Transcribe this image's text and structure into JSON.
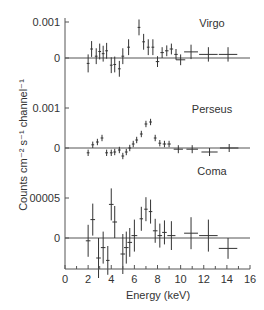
{
  "chart_data": {
    "type": "scatter",
    "title": "",
    "xlabel": "Energy (keV)",
    "ylabel": "Counts cm⁻² s⁻¹ channel⁻¹",
    "xlim": [
      0,
      16
    ],
    "x_ticks": [
      0,
      2,
      4,
      6,
      8,
      10,
      12,
      14,
      16
    ],
    "x_tick_labels": [
      "0",
      "2",
      "4",
      "6",
      "8",
      "10",
      "12",
      "14",
      "16"
    ],
    "grid": false,
    "panels": [
      {
        "name": "Virgo",
        "y_ticks": [
          0,
          0.001
        ],
        "y_tick_labels": [
          "0",
          "0.001"
        ],
        "ylim": [
          -0.0005,
          0.0011
        ],
        "points": [
          {
            "x": 2.0,
            "y": -0.00015,
            "xerr": 0.12,
            "yerr": 0.00025
          },
          {
            "x": 2.3,
            "y": 0.00025,
            "xerr": 0.12,
            "yerr": 0.00022
          },
          {
            "x": 2.7,
            "y": 5e-05,
            "xerr": 0.12,
            "yerr": 0.00022
          },
          {
            "x": 3.0,
            "y": 0.00018,
            "xerr": 0.12,
            "yerr": 0.00022
          },
          {
            "x": 3.3,
            "y": 0.00012,
            "xerr": 0.12,
            "yerr": 0.00022
          },
          {
            "x": 3.6,
            "y": 0.0002,
            "xerr": 0.12,
            "yerr": 0.00022
          },
          {
            "x": 4.0,
            "y": -0.0002,
            "xerr": 0.12,
            "yerr": 0.00022
          },
          {
            "x": 4.3,
            "y": -0.00018,
            "xerr": 0.12,
            "yerr": 0.00022
          },
          {
            "x": 4.7,
            "y": -0.0003,
            "xerr": 0.12,
            "yerr": 0.00022
          },
          {
            "x": 5.0,
            "y": 5e-05,
            "xerr": 0.12,
            "yerr": 0.00022
          },
          {
            "x": 5.5,
            "y": 0.0003,
            "xerr": 0.12,
            "yerr": 0.00022
          },
          {
            "x": 6.4,
            "y": 0.00085,
            "xerr": 0.12,
            "yerr": 0.00022
          },
          {
            "x": 6.8,
            "y": 0.00045,
            "xerr": 0.12,
            "yerr": 0.00022
          },
          {
            "x": 7.2,
            "y": 0.0003,
            "xerr": 0.12,
            "yerr": 0.00022
          },
          {
            "x": 7.6,
            "y": 0.0003,
            "xerr": 0.12,
            "yerr": 0.00022
          },
          {
            "x": 8.0,
            "y": -0.0001,
            "xerr": 0.15,
            "yerr": 0.00015
          },
          {
            "x": 8.4,
            "y": 0.00015,
            "xerr": 0.15,
            "yerr": 0.00015
          },
          {
            "x": 8.8,
            "y": 0.0002,
            "xerr": 0.15,
            "yerr": 0.00015
          },
          {
            "x": 9.2,
            "y": 0.00025,
            "xerr": 0.15,
            "yerr": 0.00015
          },
          {
            "x": 9.6,
            "y": 0.0001,
            "xerr": 0.15,
            "yerr": 0.00015
          },
          {
            "x": 10.0,
            "y": -5e-05,
            "xerr": 0.4,
            "yerr": 0.00015
          },
          {
            "x": 10.9,
            "y": 0.00017,
            "xerr": 0.6,
            "yerr": 0.0002
          },
          {
            "x": 12.4,
            "y": 0.0001,
            "xerr": 0.8,
            "yerr": 0.0002
          },
          {
            "x": 14.1,
            "y": 0.0001,
            "xerr": 0.8,
            "yerr": 0.0002
          }
        ]
      },
      {
        "name": "Perseus",
        "y_ticks": [
          0,
          0.001
        ],
        "y_tick_labels": [
          "0",
          "0.001"
        ],
        "ylim": [
          -0.0004,
          0.0011
        ],
        "points": [
          {
            "x": 2.0,
            "y": -0.00012,
            "xerr": 0.12,
            "yerr": 8e-05
          },
          {
            "x": 2.4,
            "y": 8e-05,
            "xerr": 0.12,
            "yerr": 8e-05
          },
          {
            "x": 2.8,
            "y": 0.00015,
            "xerr": 0.12,
            "yerr": 8e-05
          },
          {
            "x": 3.2,
            "y": 0.00025,
            "xerr": 0.12,
            "yerr": 8e-05
          },
          {
            "x": 3.6,
            "y": -0.00012,
            "xerr": 0.12,
            "yerr": 8e-05
          },
          {
            "x": 4.0,
            "y": -0.00012,
            "xerr": 0.12,
            "yerr": 8e-05
          },
          {
            "x": 4.3,
            "y": -0.0001,
            "xerr": 0.12,
            "yerr": 8e-05
          },
          {
            "x": 4.7,
            "y": -5e-05,
            "xerr": 0.12,
            "yerr": 8e-05
          },
          {
            "x": 5.0,
            "y": -0.0002,
            "xerr": 0.12,
            "yerr": 8e-05
          },
          {
            "x": 5.3,
            "y": -0.0001,
            "xerr": 0.12,
            "yerr": 8e-05
          },
          {
            "x": 5.6,
            "y": 0.0,
            "xerr": 0.12,
            "yerr": 8e-05
          },
          {
            "x": 5.9,
            "y": 0.0001,
            "xerr": 0.12,
            "yerr": 8e-05
          },
          {
            "x": 6.2,
            "y": 0.0002,
            "xerr": 0.12,
            "yerr": 8e-05
          },
          {
            "x": 6.6,
            "y": 0.00035,
            "xerr": 0.12,
            "yerr": 8e-05
          },
          {
            "x": 7.0,
            "y": 0.0006,
            "xerr": 0.12,
            "yerr": 8e-05
          },
          {
            "x": 7.4,
            "y": 0.00065,
            "xerr": 0.12,
            "yerr": 8e-05
          },
          {
            "x": 7.8,
            "y": 0.00025,
            "xerr": 0.12,
            "yerr": 8e-05
          },
          {
            "x": 8.2,
            "y": 0.00012,
            "xerr": 0.12,
            "yerr": 8e-05
          },
          {
            "x": 8.6,
            "y": 0.0001,
            "xerr": 0.15,
            "yerr": 8e-05
          },
          {
            "x": 9.0,
            "y": 0.0001,
            "xerr": 0.15,
            "yerr": 8e-05
          },
          {
            "x": 9.8,
            "y": -3e-05,
            "xerr": 0.4,
            "yerr": 0.0001
          },
          {
            "x": 11.0,
            "y": -3e-05,
            "xerr": 0.5,
            "yerr": 0.0001
          },
          {
            "x": 12.5,
            "y": -0.0001,
            "xerr": 0.7,
            "yerr": 0.0001
          },
          {
            "x": 14.2,
            "y": 0.0,
            "xerr": 0.8,
            "yerr": 0.0001
          }
        ]
      },
      {
        "name": "Coma",
        "y_ticks": [
          0,
          5e-05
        ],
        "y_tick_labels": [
          "0",
          "00005"
        ],
        "ylim": [
          -4e-05,
          6e-05
        ],
        "points": [
          {
            "x": 2.0,
            "y": -3.5e-06,
            "xerr": 0.2,
            "yerr": 2e-05
          },
          {
            "x": 2.4,
            "y": 2.3e-05,
            "xerr": 0.2,
            "yerr": 2e-05
          },
          {
            "x": 2.9,
            "y": -2.5e-05,
            "xerr": 0.2,
            "yerr": 2.5e-05
          },
          {
            "x": 3.3,
            "y": -1.2e-05,
            "xerr": 0.2,
            "yerr": 2e-05
          },
          {
            "x": 3.7,
            "y": -2.8e-05,
            "xerr": 0.15,
            "yerr": 1.8e-05
          },
          {
            "x": 4.0,
            "y": 4.2e-05,
            "xerr": 0.2,
            "yerr": 2e-05
          },
          {
            "x": 4.3,
            "y": 2e-05,
            "xerr": 0.2,
            "yerr": 2e-05
          },
          {
            "x": 5.0,
            "y": -2e-05,
            "xerr": 0.2,
            "yerr": 2.5e-05
          },
          {
            "x": 5.3,
            "y": -1.2e-05,
            "xerr": 0.2,
            "yerr": 2e-05
          },
          {
            "x": 5.6,
            "y": -5.5e-06,
            "xerr": 0.2,
            "yerr": 1.8e-05
          },
          {
            "x": 6.0,
            "y": 3e-06,
            "xerr": 0.25,
            "yerr": 2e-05
          },
          {
            "x": 6.6,
            "y": 2.4e-05,
            "xerr": 0.15,
            "yerr": 1.5e-05
          },
          {
            "x": 7.0,
            "y": 3.6e-05,
            "xerr": 0.15,
            "yerr": 1.5e-05
          },
          {
            "x": 7.4,
            "y": 3.3e-05,
            "xerr": 0.15,
            "yerr": 1.5e-05
          },
          {
            "x": 7.8,
            "y": 9e-06,
            "xerr": 0.2,
            "yerr": 1.5e-05
          },
          {
            "x": 8.2,
            "y": 3e-06,
            "xerr": 0.2,
            "yerr": 1.5e-05
          },
          {
            "x": 8.6,
            "y": 7e-06,
            "xerr": 0.2,
            "yerr": 1.5e-05
          },
          {
            "x": 9.2,
            "y": 3e-06,
            "xerr": 0.35,
            "yerr": 1.8e-05
          },
          {
            "x": 10.9,
            "y": 6e-06,
            "xerr": 0.6,
            "yerr": 2e-05
          },
          {
            "x": 12.4,
            "y": 3e-06,
            "xerr": 0.8,
            "yerr": 2e-05
          },
          {
            "x": 14.1,
            "y": -1.3e-05,
            "xerr": 0.8,
            "yerr": 1.3e-05
          }
        ]
      }
    ]
  }
}
